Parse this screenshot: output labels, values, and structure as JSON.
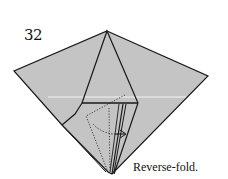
{
  "diagram": {
    "step_number": "32",
    "caption": "Reverse-fold.",
    "colors": {
      "paper": "#c4c4c4",
      "line": "#1a1a1a",
      "crease": "#ffffff"
    }
  }
}
